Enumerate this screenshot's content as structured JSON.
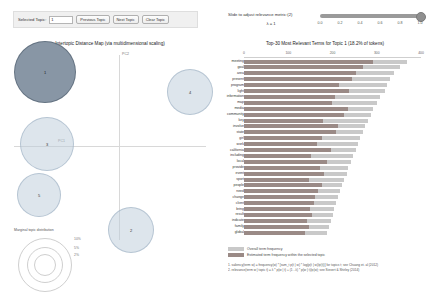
{
  "controls": {
    "selected_topic_label": "Selected Topic:",
    "selected_topic_value": "1",
    "previous_topic_label": "Previous Topic",
    "next_topic_label": "Next Topic",
    "clear_topic_label": "Clear Topic"
  },
  "slider": {
    "label": "Slide to adjust relevance metric:(2)",
    "lambda_text": "λ = 1",
    "value": 1.0,
    "ticks": [
      "0.0",
      "0.2",
      "0.4",
      "0.6",
      "0.8",
      "1.0"
    ]
  },
  "left_panel": {
    "title": "Intertopic Distance Map (via multidimensional scaling)",
    "axis_x_label": "PC1",
    "axis_y_label": "PC2",
    "marginal_caption": "Marginal topic distribution",
    "marginal_ticks": [
      "2%",
      "5%",
      "10%"
    ],
    "topics": [
      {
        "id": "1",
        "x": 38,
        "y": 22,
        "r": 30,
        "selected": true
      },
      {
        "id": "4",
        "x": 183,
        "y": 42,
        "r": 22,
        "selected": false
      },
      {
        "id": "3",
        "x": 40,
        "y": 94,
        "r": 26,
        "selected": false
      },
      {
        "id": "5",
        "x": 32,
        "y": 145,
        "r": 21,
        "selected": false
      },
      {
        "id": "2",
        "x": 124,
        "y": 180,
        "r": 22,
        "selected": false
      }
    ]
  },
  "right_panel": {
    "title": "Top-30 Most Relevant Terms for Topic 1 (18.2% of tokens)",
    "axis_ticks": [
      "0",
      "100",
      "200",
      "300",
      "400"
    ],
    "axis_max": 400,
    "legend": {
      "overall": "Overall term frequency",
      "estimated": "Estimated term frequency within the selected topic"
    },
    "footnotes": [
      "1. saliency(term w) = frequency(w) * [sum_t p(t | w) * log(p(t | w)/p(t))] for topics t; see Chuang et. al (2012)",
      "2. relevance(term w | topic t) = λ * p(w | t) + (1 - λ) * p(w | t)/p(w); see Sievert & Shirley (2014)"
    ]
  },
  "chart_data": {
    "type": "bar",
    "title": "Top-30 Most Relevant Terms for Topic 1 (18.2% of tokens)",
    "xlabel": "",
    "ylabel": "",
    "xlim": [
      0,
      400
    ],
    "grid": false,
    "legend_position": "bottom",
    "orientation": "horizontal",
    "categories": [
      "meeting",
      "goal",
      "area",
      "present",
      "program",
      "light",
      "information",
      "map",
      "media",
      "community",
      "key",
      "involve",
      "state",
      "girl",
      "work",
      "california",
      "including",
      "local",
      "provide",
      "event",
      "sport",
      "people",
      "need",
      "change",
      "client",
      "bring",
      "result",
      "indicate",
      "family",
      "global"
    ],
    "series": [
      {
        "name": "Overall term frequency",
        "color": "#c9c9c9",
        "values": [
          368,
          352,
          338,
          330,
          324,
          318,
          308,
          300,
          292,
          286,
          280,
          274,
          268,
          262,
          258,
          252,
          246,
          242,
          236,
          232,
          226,
          222,
          216,
          212,
          208,
          204,
          200,
          196,
          192,
          188
        ]
      },
      {
        "name": "Estimated term frequency within the selected topic",
        "color": "#9a8a86",
        "values": [
          292,
          268,
          252,
          244,
          214,
          238,
          206,
          198,
          234,
          226,
          178,
          212,
          208,
          176,
          164,
          196,
          152,
          188,
          172,
          180,
          146,
          176,
          168,
          160,
          158,
          150,
          154,
          142,
          148,
          138
        ]
      }
    ]
  }
}
